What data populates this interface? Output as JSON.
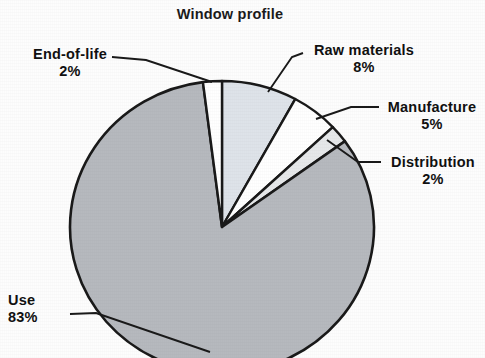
{
  "chart_data": {
    "type": "pie",
    "title": "Window profile",
    "xlabel": "",
    "ylabel": "",
    "legend_position": "none",
    "grid": false,
    "labels_outside": true,
    "categories": [
      "Raw materials",
      "Manufacture",
      "Distribution",
      "Use",
      "End-of-life"
    ],
    "values": [
      8,
      5,
      2,
      83,
      2
    ],
    "value_suffix": "%",
    "slices": [
      {
        "label": "Raw materials",
        "value": 8,
        "value_text": "8%",
        "color": "#dee3e9",
        "start_angle_deg": 0,
        "end_angle_deg": 28.8
      },
      {
        "label": "Manufacture",
        "value": 5,
        "value_text": "5%",
        "color": "#ffffff",
        "start_angle_deg": 28.8,
        "end_angle_deg": 46.8
      },
      {
        "label": "Distribution",
        "value": 2,
        "value_text": "2%",
        "color": "#e6e8ea",
        "start_angle_deg": 46.8,
        "end_angle_deg": 54.0
      },
      {
        "label": "Use",
        "value": 83,
        "value_text": "83%",
        "color": "#b6b9be",
        "start_angle_deg": 54.0,
        "end_angle_deg": 352.8
      },
      {
        "label": "End-of-life",
        "value": 2,
        "value_text": "2%",
        "color": "#ffffff",
        "start_angle_deg": 352.8,
        "end_angle_deg": 360.0
      }
    ],
    "outline_color": "#1a1a1a",
    "background_color": "#fdfdfd"
  },
  "title": "Window profile",
  "labels": {
    "raw_materials": {
      "name": "Raw materials",
      "percent": "8%"
    },
    "manufacture": {
      "name": "Manufacture",
      "percent": "5%"
    },
    "distribution": {
      "name": "Distribution",
      "percent": "2%"
    },
    "use": {
      "name": "Use",
      "percent": "83%"
    },
    "end_of_life": {
      "name": "End-of-life",
      "percent": "2%"
    }
  }
}
